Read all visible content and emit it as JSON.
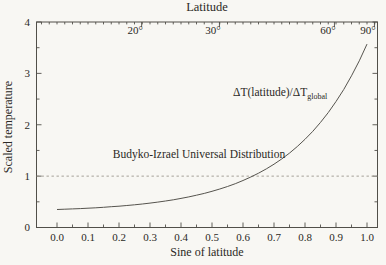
{
  "chart_data": {
    "type": "line",
    "title": "Latitude",
    "xlabel": "Sine of latitude",
    "ylabel": "Scaled temperature",
    "xlim": [
      -0.066,
      1.035
    ],
    "ylim": [
      0,
      4
    ],
    "grid": false,
    "x_tick_labels": [
      "0.0",
      "0.1",
      "0.2",
      "0.3",
      "0.4",
      "0.5",
      "0.6",
      "0.7",
      "0.8",
      "0.9",
      "1.0"
    ],
    "x_tick_values": [
      0,
      0.1,
      0.2,
      0.3,
      0.4,
      0.5,
      0.6,
      0.7,
      0.8,
      0.9,
      1.0
    ],
    "x_minor_step": 0.05,
    "y_tick_labels": [
      "0",
      "1",
      "2",
      "3",
      "4"
    ],
    "y_tick_values": [
      0,
      1,
      2,
      3,
      4
    ],
    "y_minor_step": 0.5,
    "top_axis": {
      "label": "Latitude",
      "minor_step": 0.025,
      "ticks": [
        {
          "label": "20°",
          "x": 0.252
        },
        {
          "label": "30°",
          "x": 0.503
        },
        {
          "label": "60°",
          "x": 0.874
        },
        {
          "label": "90°",
          "x": 1.003
        }
      ]
    },
    "reference_line": {
      "y": 1.0,
      "style": "dashed",
      "color": "#9b968c"
    },
    "series": [
      {
        "name": "Budyko-Izrael universal distribution",
        "x": [
          0,
          0.025,
          0.05,
          0.075,
          0.1,
          0.125,
          0.15,
          0.175,
          0.2,
          0.225,
          0.25,
          0.275,
          0.3,
          0.325,
          0.35,
          0.375,
          0.4,
          0.425,
          0.45,
          0.475,
          0.5,
          0.525,
          0.55,
          0.575,
          0.6,
          0.625,
          0.65,
          0.675,
          0.7,
          0.725,
          0.75,
          0.775,
          0.8,
          0.825,
          0.85,
          0.875,
          0.9,
          0.925,
          0.95,
          0.975,
          1.0
        ],
        "y": [
          0.35,
          0.356,
          0.362,
          0.368,
          0.376,
          0.384,
          0.394,
          0.404,
          0.415,
          0.428,
          0.442,
          0.458,
          0.475,
          0.494,
          0.516,
          0.54,
          0.566,
          0.596,
          0.628,
          0.664,
          0.704,
          0.749,
          0.798,
          0.853,
          0.914,
          0.982,
          1.057,
          1.14,
          1.233,
          1.336,
          1.449,
          1.576,
          1.717,
          1.873,
          2.046,
          2.238,
          2.452,
          2.689,
          2.953,
          3.244,
          3.569
        ]
      }
    ],
    "annotations": {
      "budyko": {
        "text": "Budyko-Izrael Universal Distribution",
        "x": 0.46,
        "y": 1.38
      },
      "delta_ratio": {
        "main": "ΔT(latitude)/ΔT",
        "sub": "global",
        "x": 0.57,
        "y": 2.57
      }
    },
    "colors": {
      "background": "#f8f7f3",
      "line": "#56544e",
      "frame": "#514f49",
      "text": "#2b2925",
      "reference": "#9b968c"
    }
  }
}
